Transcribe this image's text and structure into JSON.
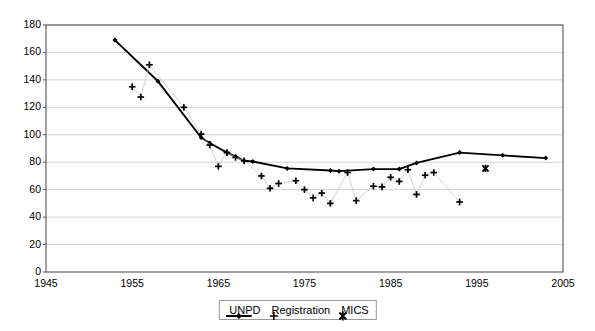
{
  "chart_data": {
    "type": "line",
    "title": "",
    "xlabel": "",
    "ylabel": "",
    "xlim": [
      1945,
      2005
    ],
    "ylim": [
      0,
      180
    ],
    "xticks": [
      1945,
      1955,
      1965,
      1975,
      1985,
      1995,
      2005
    ],
    "yticks": [
      0,
      20,
      40,
      60,
      80,
      100,
      120,
      140,
      160,
      180
    ],
    "grid": "horizontal",
    "legend_position": "bottom-center",
    "series": [
      {
        "name": "UNPD",
        "marker": "diamond",
        "style": "line-with-markers",
        "color": "#000000",
        "points": [
          [
            1953,
            169
          ],
          [
            1958,
            139
          ],
          [
            1963,
            98
          ],
          [
            1964,
            94
          ],
          [
            1966,
            87
          ],
          [
            1967,
            84
          ],
          [
            1968,
            81
          ],
          [
            1969,
            80.5
          ],
          [
            1973,
            75.5
          ],
          [
            1978,
            74
          ],
          [
            1979,
            73.5
          ],
          [
            1983,
            75
          ],
          [
            1986,
            75
          ],
          [
            1988,
            79.5
          ],
          [
            1993,
            87
          ],
          [
            1998,
            85
          ],
          [
            2003,
            83
          ]
        ]
      },
      {
        "name": "Registration",
        "marker": "plus",
        "style": "markers-with-thin-connector",
        "color": "#000000",
        "points": [
          [
            1955,
            135
          ],
          [
            1956,
            127.5
          ],
          [
            1957,
            151
          ],
          [
            1961,
            120
          ],
          [
            1963,
            100.5
          ],
          [
            1964,
            92.5
          ],
          [
            1965,
            77
          ],
          [
            1966,
            87
          ],
          [
            1967,
            83.5
          ],
          [
            1968,
            81
          ],
          [
            1970,
            70
          ],
          [
            1971,
            61
          ],
          [
            1972,
            64.5
          ],
          [
            1974,
            66.5
          ],
          [
            1975,
            60
          ],
          [
            1976,
            54
          ],
          [
            1977,
            57.5
          ],
          [
            1978,
            50
          ],
          [
            1980,
            72.5
          ],
          [
            1981,
            52
          ],
          [
            1983,
            62.5
          ],
          [
            1984,
            62
          ],
          [
            1985,
            69
          ],
          [
            1986,
            66
          ],
          [
            1987,
            74.5
          ],
          [
            1988,
            56.5
          ],
          [
            1989,
            70.5
          ],
          [
            1990,
            72.5
          ],
          [
            1993,
            51
          ]
        ]
      },
      {
        "name": "MICS",
        "marker": "asterisk",
        "style": "markers-only",
        "color": "#000000",
        "points": [
          [
            1996,
            75.5
          ]
        ]
      }
    ]
  },
  "axes": {
    "y_tick_labels": [
      "180",
      "160",
      "140",
      "120",
      "100",
      "80",
      "60",
      "40",
      "20",
      "0"
    ],
    "x_tick_labels": [
      "1945",
      "1955",
      "1965",
      "1975",
      "1985",
      "1995",
      "2005"
    ]
  },
  "legend": {
    "items": [
      {
        "label": "UNPD",
        "icon": "line-diamond-marker"
      },
      {
        "label": "Registration",
        "icon": "plus-marker"
      },
      {
        "label": "MICS",
        "icon": "asterisk-marker"
      }
    ]
  }
}
